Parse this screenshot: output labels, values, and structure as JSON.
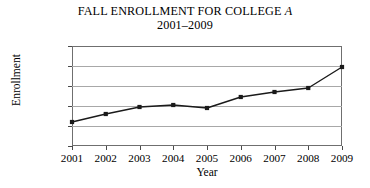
{
  "chart_data": {
    "type": "line",
    "title": "FALL ENROLLMENT FOR COLLEGE A",
    "title_prefix": "FALL ENROLLMENT FOR COLLEGE ",
    "title_italic": "A",
    "subtitle": "2001–2009",
    "xlabel": "Year",
    "ylabel": "Enrollment",
    "categories": [
      "2001",
      "2002",
      "2003",
      "2004",
      "2005",
      "2006",
      "2007",
      "2008",
      "2009"
    ],
    "x": [
      2001,
      2002,
      2003,
      2004,
      2005,
      2006,
      2007,
      2008,
      2009
    ],
    "values": [
      1200,
      1600,
      1950,
      2050,
      1900,
      2450,
      2700,
      2900,
      3950
    ],
    "ylim": [
      0,
      5000
    ],
    "ytick_values": [
      0,
      1000,
      2000,
      3000,
      4000,
      5000
    ],
    "ytick_labels": [
      "0",
      "1,000",
      "2,000",
      "3,000",
      "4,000",
      "5,000"
    ],
    "xlim": [
      2001,
      2009
    ],
    "grid": "horizontal",
    "legend": "none",
    "line_color": "#1a1a1a",
    "marker": "square",
    "marker_color": "#1a1a1a",
    "grid_color": "#a8a8a8",
    "frame_color": "#6f6f6f",
    "background": "#ffffff"
  }
}
